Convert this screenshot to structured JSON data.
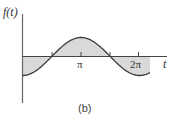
{
  "figure": {
    "y_label": "f(t)",
    "x_label": "t",
    "ticks": [
      "π",
      "2π"
    ],
    "caption": "(b)",
    "colors": {
      "curve": "#3a3a3a",
      "fill": "#d9d9d9",
      "axis": "#666666"
    }
  },
  "chart_data": {
    "type": "line",
    "title": "",
    "function": "f(t) = -cos(t)",
    "xlabel": "t",
    "ylabel": "f(t)",
    "x_ticks": [
      "π",
      "2π"
    ],
    "x_range": [
      0,
      6.9
    ],
    "y_range": [
      -1,
      1
    ],
    "shaded_area": "between curve and t-axis",
    "caption": "(b)",
    "grid": false
  }
}
